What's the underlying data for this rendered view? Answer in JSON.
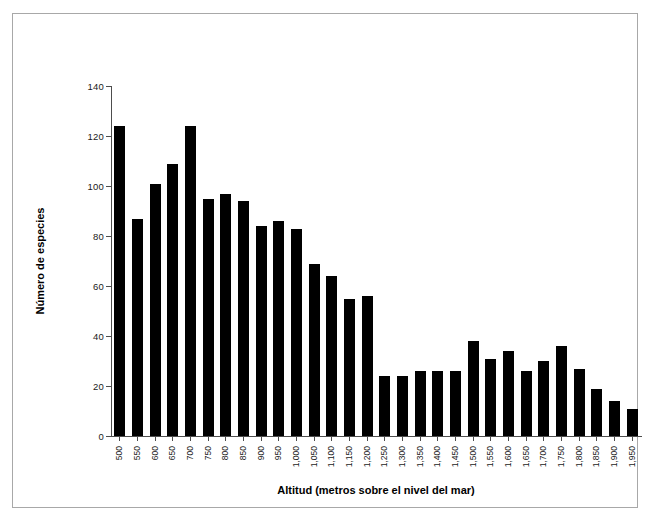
{
  "chart_data": {
    "type": "bar",
    "title": "",
    "xlabel": "Altitud (metros sobre el nivel del mar)",
    "ylabel": "Número de especies",
    "ylim": [
      0,
      140
    ],
    "yticks": [
      0,
      20,
      40,
      60,
      80,
      100,
      120,
      140
    ],
    "ytick_labels": [
      "0",
      "20",
      "40",
      "60",
      "80",
      "100",
      "120",
      "140"
    ],
    "grid": false,
    "legend": null,
    "bar_color": "#000000",
    "categories": [
      "500",
      "550",
      "600",
      "650",
      "700",
      "750",
      "800",
      "850",
      "900",
      "950",
      "1,000",
      "1,050",
      "1,100",
      "1,150",
      "1,200",
      "1,250",
      "1,300",
      "1,350",
      "1,400",
      "1,450",
      "1,500",
      "1,550",
      "1,600",
      "1,650",
      "1,700",
      "1,750",
      "1,800",
      "1,850",
      "1,900",
      "1,950"
    ],
    "values": [
      124,
      87,
      101,
      109,
      124,
      95,
      97,
      94,
      84,
      86,
      83,
      69,
      64,
      55,
      56,
      24,
      24,
      26,
      26,
      26,
      38,
      31,
      34,
      26,
      30,
      36,
      27,
      19,
      14,
      11
    ]
  }
}
